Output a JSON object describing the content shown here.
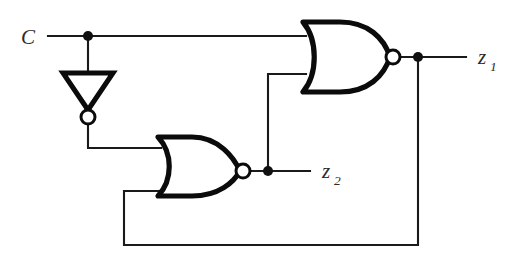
{
  "diagram": {
    "type": "logic-circuit-schematic",
    "canvas": {
      "width": 517,
      "height": 257
    },
    "background_color": "#ffffff",
    "line_color": "#1a1a1a",
    "gate_outline_color": "#0b0b0b"
  },
  "labels": {
    "input_c": "C",
    "output_z1_base": "z",
    "output_z1_sub": "1",
    "output_z2_base": "z",
    "output_z2_sub": "2"
  },
  "components": [
    {
      "id": "inverter-1",
      "name": "inverter",
      "symbol": "NOT",
      "orientation": "down",
      "input_label": "C",
      "output_label": "C'"
    },
    {
      "id": "nor-gate-1",
      "name": "nor-gate",
      "symbol": "NOR",
      "inputs": [
        "C",
        "z2"
      ],
      "output_label": "z1"
    },
    {
      "id": "nor-gate-2",
      "name": "nor-gate",
      "symbol": "NOR",
      "inputs": [
        "C'",
        "z1"
      ],
      "output_label": "z2"
    }
  ],
  "nets": [
    {
      "id": "net-c",
      "name": "c-input-net",
      "from": "C",
      "to": [
        "inverter-1.in",
        "nor-gate-1.in1"
      ]
    },
    {
      "id": "net-cbar",
      "name": "inverter-output-net",
      "from": "inverter-1.out",
      "to": [
        "nor-gate-2.in1"
      ]
    },
    {
      "id": "net-z1",
      "name": "z1-output-net",
      "from": "nor-gate-1.out",
      "to": [
        "z1",
        "nor-gate-2.in2"
      ]
    },
    {
      "id": "net-z2",
      "name": "z2-output-net",
      "from": "nor-gate-2.out",
      "to": [
        "z2",
        "nor-gate-1.in2"
      ]
    }
  ],
  "junctions": [
    {
      "id": "junction-c",
      "name": "c-branch-dot",
      "x": 88,
      "y": 36
    },
    {
      "id": "junction-z1",
      "name": "z1-branch-dot",
      "x": 418,
      "y": 57
    },
    {
      "id": "junction-z2",
      "name": "z2-branch-dot",
      "x": 268,
      "y": 171
    }
  ]
}
